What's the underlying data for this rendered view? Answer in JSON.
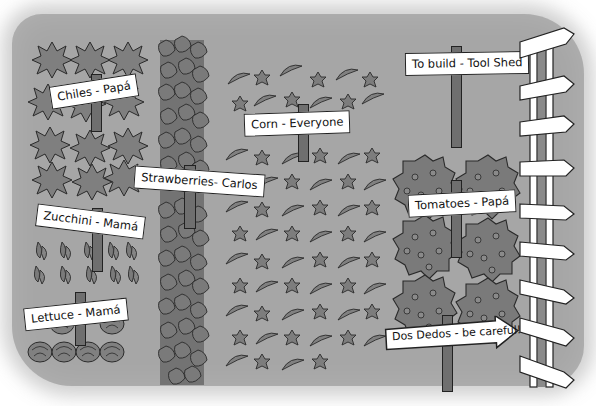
{
  "scene": {
    "description": "Garden map illustration with labeled planting beds",
    "colors": {
      "ground": "#a6a6a6",
      "plant": "#7f7f7f",
      "plant_outline": "#2a2a2a",
      "sign_bg": "#ffffff",
      "post": "#6f6f6f"
    }
  },
  "signs": {
    "chiles": "Chiles - Papá",
    "strawberries": "Strawberries- Carlos",
    "corn": "Corn - Everyone",
    "zucchini": "Zucchini - Mamá",
    "lettuce": "Lettuce - Mamá",
    "tool_shed": "To build - Tool Shed",
    "tomatoes": "Tomatoes - Papá",
    "dos_dedos": "Dos Dedos - be careful!"
  }
}
